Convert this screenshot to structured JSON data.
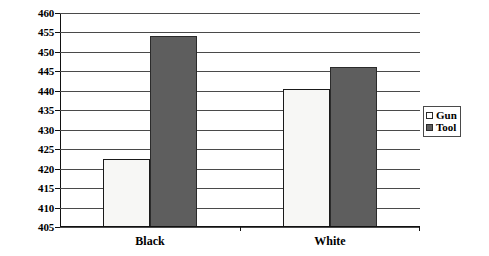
{
  "chart_data": {
    "type": "bar",
    "title": "",
    "subtitle": "",
    "xlabel": "",
    "ylabel": "",
    "categories": [
      "Black",
      "White"
    ],
    "series": [
      {
        "name": "Gun",
        "values": [
          422.5,
          440.5
        ],
        "color": "#f7f7f5"
      },
      {
        "name": "Tool",
        "values": [
          454.0,
          446.0
        ],
        "color": "#5e5e5e"
      }
    ],
    "ylim": [
      405,
      460
    ],
    "ytick_step": 5,
    "yticks": [
      460,
      455,
      450,
      445,
      440,
      435,
      430,
      425,
      420,
      415,
      410,
      405
    ],
    "grid": true,
    "legend_position": "right",
    "annotations": []
  },
  "legend": {
    "items": [
      {
        "label": "Gun",
        "swatch": "gun"
      },
      {
        "label": "Tool",
        "swatch": "tool"
      }
    ]
  },
  "colors": {
    "gun_fill": "#f7f7f5",
    "tool_fill": "#5e5e5e",
    "bar_outline": "#1a1a1a",
    "gridline": "#4a4a4a",
    "axis": "#111111",
    "background": "#ffffff"
  }
}
